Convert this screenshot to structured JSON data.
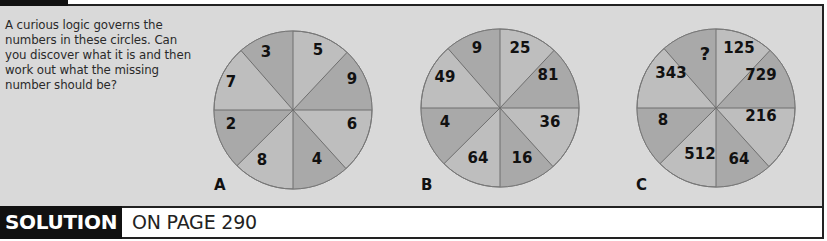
{
  "puzzle": {
    "intro_lines": [
      "A curious logic governs the",
      "numbers in these circles. Can",
      "you discover what it is and then",
      "work out what the missing",
      "number should be?"
    ],
    "circles": [
      {
        "label": "A",
        "sectors": [
          {
            "pos": "top-left",
            "value": "3"
          },
          {
            "pos": "top-right",
            "value": "5"
          },
          {
            "pos": "upper-right",
            "value": "9"
          },
          {
            "pos": "lower-right",
            "value": "6"
          },
          {
            "pos": "bottom-right",
            "value": "4"
          },
          {
            "pos": "bottom-left",
            "value": "8"
          },
          {
            "pos": "lower-left",
            "value": "2"
          },
          {
            "pos": "upper-left",
            "value": "7"
          }
        ]
      },
      {
        "label": "B",
        "sectors": [
          {
            "pos": "top-left",
            "value": "9"
          },
          {
            "pos": "top-right",
            "value": "25"
          },
          {
            "pos": "upper-right",
            "value": "81"
          },
          {
            "pos": "lower-right",
            "value": "36"
          },
          {
            "pos": "bottom-right",
            "value": "16"
          },
          {
            "pos": "bottom-left",
            "value": "64"
          },
          {
            "pos": "lower-left",
            "value": "4"
          },
          {
            "pos": "upper-left",
            "value": "49"
          }
        ]
      },
      {
        "label": "C",
        "sectors": [
          {
            "pos": "top-left",
            "value": "?"
          },
          {
            "pos": "top-right",
            "value": "125"
          },
          {
            "pos": "upper-right",
            "value": "729"
          },
          {
            "pos": "lower-right",
            "value": "216"
          },
          {
            "pos": "bottom-right",
            "value": "64"
          },
          {
            "pos": "bottom-left",
            "value": "512"
          },
          {
            "pos": "lower-left",
            "value": "8"
          },
          {
            "pos": "upper-left",
            "value": "343"
          }
        ]
      }
    ]
  },
  "solution": {
    "label": "SOLUTION",
    "reference": "ON PAGE 290"
  },
  "colors": {
    "panel_bg": "#d9d9d9",
    "sector_dark": "#a9a9a9",
    "sector_light": "#bebebe",
    "line": "#6e6e6e",
    "ink": "#111111"
  }
}
